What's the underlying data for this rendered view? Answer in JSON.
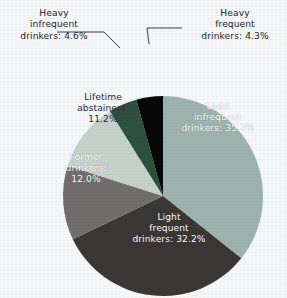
{
  "chart_data": {
    "type": "pie",
    "title": "",
    "subtitle": "",
    "xlabel": "",
    "ylabel": "",
    "legend_position": "none",
    "grid": false,
    "value_unit": "%",
    "start_angle_deg": 0,
    "direction": "clockwise",
    "categories": [
      "Light infrequent drinkers",
      "Light frequent drinkers",
      "Former drinkers",
      "Lifetime abstainers",
      "Heavy infrequent drinkers",
      "Heavy frequent drinkers"
    ],
    "values": [
      35.7,
      32.2,
      12.0,
      11.2,
      4.6,
      4.3
    ],
    "slices": [
      {
        "name": "Light infrequent drinkers",
        "value": 35.7,
        "label_text": "Light\ninfrequent\ndrinkers: 35.7%",
        "color": "#9cb4ad",
        "label_placement": "inside",
        "label_color": "#ffffff"
      },
      {
        "name": "Light frequent drinkers",
        "value": 32.2,
        "label_text": "Light\nfrequent\ndrinkers: 32.2%",
        "color": "#3a3735",
        "label_placement": "inside",
        "label_color": "#ffffff"
      },
      {
        "name": "Former drinkers",
        "value": 12.0,
        "label_text": "Former\ndrinkers:\n12.0%",
        "color": "#706f6d",
        "label_placement": "inside",
        "label_color": "#ffffff"
      },
      {
        "name": "Lifetime abstainers",
        "value": 11.2,
        "label_text": "Lifetime\nabstainers:\n11.2%",
        "color": "#c5d1cb",
        "label_placement": "inside",
        "label_color": "#2b2b2b"
      },
      {
        "name": "Heavy infrequent drinkers",
        "value": 4.6,
        "label_text": "Heavy\ninfrequent\ndrinkers: 4.6%",
        "color": "#2d5040",
        "label_placement": "callout-top-left",
        "label_color": "#1d1d1d"
      },
      {
        "name": "Heavy frequent drinkers",
        "value": 4.3,
        "label_text": "Heavy\nfrequent\ndrinkers: 4.3%",
        "color": "#080808",
        "label_placement": "callout-top-right",
        "label_color": "#1d1d1d"
      }
    ]
  },
  "figure": {
    "background_color": "#f5f6f7",
    "leader_line_color": "#2a2a2a"
  }
}
